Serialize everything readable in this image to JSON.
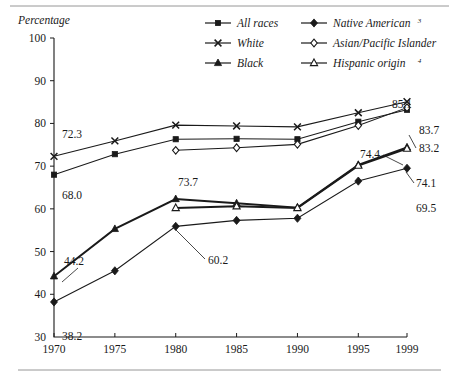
{
  "figure": {
    "y_axis_title": "Percentage",
    "top_rule": true,
    "bottom_rule": true
  },
  "legend": {
    "entries": [
      {
        "label": "All races",
        "marker": "filled-square-marker",
        "sup": ""
      },
      {
        "label": "White",
        "marker": "x-cross-marker",
        "sup": ""
      },
      {
        "label": "Black",
        "marker": "filled-triangle-marker",
        "sup": ""
      },
      {
        "label": "Native American",
        "marker": "filled-diamond-marker",
        "sup": "3"
      },
      {
        "label": "Asian/Pacific Islander",
        "marker": "open-diamond-marker",
        "sup": ""
      },
      {
        "label": "Hispanic origin",
        "marker": "open-triangle-marker",
        "sup": "4"
      }
    ]
  },
  "chart_data": {
    "type": "line",
    "title": "",
    "xlabel": "",
    "ylabel": "Percentage",
    "grid": false,
    "legend_position": "top-right",
    "categories": [
      "1970",
      "1975",
      "1980",
      "1985",
      "1990",
      "1995",
      "1999"
    ],
    "x": [
      1970,
      1975,
      1980,
      1985,
      1990,
      1995,
      1999
    ],
    "xlim": [
      1970,
      1999
    ],
    "ylim": [
      30,
      100
    ],
    "yticks": [
      30,
      40,
      50,
      60,
      70,
      80,
      90,
      100
    ],
    "series": [
      {
        "name": "All races",
        "marker": "filled-square-marker",
        "values": [
          68.0,
          72.8,
          76.3,
          76.4,
          76.3,
          80.4,
          83.2
        ]
      },
      {
        "name": "White",
        "marker": "x-cross-marker",
        "values": [
          72.3,
          75.9,
          79.6,
          79.4,
          79.2,
          82.5,
          85.1
        ]
      },
      {
        "name": "Black",
        "marker": "filled-triangle-marker",
        "values": [
          44.2,
          55.3,
          62.3,
          61.3,
          60.3,
          70.3,
          74.4
        ]
      },
      {
        "name": "Native American",
        "marker": "filled-diamond-marker",
        "values": [
          38.2,
          45.5,
          55.9,
          57.3,
          57.8,
          66.5,
          69.5
        ]
      },
      {
        "name": "Asian/Pacific Islander",
        "marker": "open-diamond-marker",
        "values": [
          null,
          null,
          73.7,
          74.3,
          75.1,
          79.5,
          83.7
        ]
      },
      {
        "name": "Hispanic origin",
        "marker": "open-triangle-marker",
        "values": [
          null,
          null,
          60.2,
          60.6,
          60.2,
          70.1,
          74.1
        ]
      }
    ],
    "annotations": [
      {
        "text": "72.3",
        "series": "White",
        "x": 1970,
        "value": 72.3
      },
      {
        "text": "68.0",
        "series": "All races",
        "x": 1970,
        "value": 68.0
      },
      {
        "text": "44.2",
        "series": "Black",
        "x": 1970,
        "value": 44.2
      },
      {
        "text": "38.2",
        "series": "Native American",
        "x": 1970,
        "value": 38.2
      },
      {
        "text": "73.7",
        "series": "Asian/Pacific Islander",
        "x": 1980,
        "value": 73.7
      },
      {
        "text": "60.2",
        "series": "Hispanic origin",
        "x": 1980,
        "value": 60.2
      },
      {
        "text": "85.1",
        "series": "White",
        "x": 1999,
        "value": 85.1
      },
      {
        "text": "83.7",
        "series": "Asian/Pacific Islander",
        "x": 1999,
        "value": 83.7
      },
      {
        "text": "83.2",
        "series": "All races",
        "x": 1999,
        "value": 83.2
      },
      {
        "text": "74.4",
        "series": "Black",
        "x": 1999,
        "value": 74.4
      },
      {
        "text": "74.1",
        "series": "Hispanic origin",
        "x": 1999,
        "value": 74.1
      },
      {
        "text": "69.5",
        "series": "Native American",
        "x": 1999,
        "value": 69.5
      }
    ]
  }
}
